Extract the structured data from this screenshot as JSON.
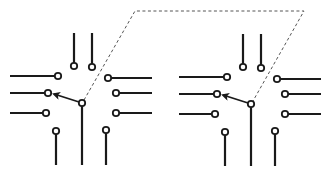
{
  "diagram": {
    "colors": {
      "stroke": "#1a1a1a",
      "dash": "#555555",
      "background": "#ffffff"
    },
    "panels": [
      {
        "id": "left",
        "offset_x": 0
      },
      {
        "id": "right",
        "offset_x": 169
      }
    ],
    "connector": {
      "style": "dashed",
      "points": [
        [
          82,
          103
        ],
        [
          135,
          11
        ],
        [
          304,
          11
        ],
        [
          251,
          104
        ]
      ]
    }
  }
}
